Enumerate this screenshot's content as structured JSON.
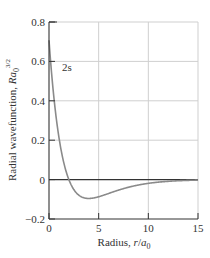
{
  "chart_data": {
    "type": "line",
    "title": "",
    "xlabel": "Radius, r/a0",
    "xlabel_parts": {
      "main": "Radius, ",
      "var": "r",
      "slash": "/",
      "a": "a",
      "sub": "0"
    },
    "ylabel": "Radial wavefunction, Ra0^3/2",
    "ylabel_parts": {
      "main": "Radial wavefunction, ",
      "var": "Ra",
      "sub": "0",
      "sup": "3/2"
    },
    "xlim": [
      0,
      15
    ],
    "ylim": [
      -0.2,
      0.8
    ],
    "xticks": [
      0,
      5,
      10,
      15
    ],
    "xtick_labels": [
      "0",
      "5",
      "10",
      "15"
    ],
    "yticks": [
      -0.2,
      0,
      0.2,
      0.4,
      0.6,
      0.8
    ],
    "ytick_labels": [
      "−0.2",
      "0",
      "0.2",
      "0.4",
      "0.6",
      "0.8"
    ],
    "grid": true,
    "annotations": [
      {
        "text": "2s",
        "x": 1.3,
        "y": 0.57
      }
    ],
    "series": [
      {
        "name": "2s",
        "color": "#8a8a8a",
        "x": [
          0,
          0.25,
          0.5,
          0.75,
          1,
          1.5,
          2,
          2.5,
          3,
          3.5,
          4,
          4.5,
          5,
          6,
          7,
          8,
          9,
          10,
          11,
          12,
          13,
          14,
          15
        ],
        "values": [
          0.707,
          0.621,
          0.546,
          0.475,
          0.413,
          0.297,
          0.0,
          -0.076,
          -0.079,
          -0.09,
          -0.096,
          -0.094,
          -0.087,
          -0.071,
          -0.053,
          -0.037,
          -0.025,
          -0.016,
          -0.01,
          -0.006,
          -0.004,
          -0.002,
          -0.001
        ]
      }
    ]
  },
  "colors": {
    "axis": "#333333",
    "grid": "#cfcfcf",
    "curve": "#8a8a8a",
    "zero_line": "#333333"
  }
}
